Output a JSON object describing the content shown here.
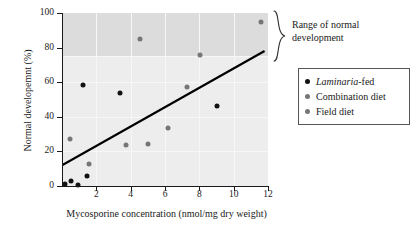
{
  "chart_data": {
    "type": "scatter",
    "title": "",
    "xlabel": "Mycosporine concentration (nmol/mg dry weight)",
    "ylabel": "Normal developemnt (%)",
    "xlim": [
      0,
      12
    ],
    "ylim": [
      0,
      100
    ],
    "xticks": [
      2,
      4,
      6,
      8,
      10,
      12
    ],
    "yticks": [
      0,
      20,
      40,
      60,
      80,
      100
    ],
    "xtick_labels": [
      "2",
      "4",
      "6",
      "8",
      "10",
      "12"
    ],
    "ytick_labels": [
      "0",
      "20",
      "40",
      "60",
      "80",
      "100"
    ],
    "grid": true,
    "legend_position": "right",
    "series": [
      {
        "name": "Laminaria-fed",
        "name_italic_prefix": "Laminaria",
        "name_suffix": "-fed",
        "color": "#111111",
        "marker": "circle",
        "points": [
          {
            "x": 0.15,
            "y": 1.0
          },
          {
            "x": 0.55,
            "y": 3.0
          },
          {
            "x": 0.95,
            "y": 0.5
          },
          {
            "x": 1.25,
            "y": 58.5
          },
          {
            "x": 1.45,
            "y": 5.5
          },
          {
            "x": 3.35,
            "y": 54.0
          },
          {
            "x": 9.0,
            "y": 46.5
          }
        ]
      },
      {
        "name": "Combination diet",
        "color": "#767676",
        "marker": "circle",
        "points": [
          {
            "x": 0.45,
            "y": 27.0
          },
          {
            "x": 1.6,
            "y": 12.5
          },
          {
            "x": 3.75,
            "y": 23.5
          },
          {
            "x": 5.0,
            "y": 24.0
          },
          {
            "x": 6.15,
            "y": 33.5
          },
          {
            "x": 7.3,
            "y": 57.5
          }
        ]
      },
      {
        "name": "Field diet",
        "color": "#767676",
        "marker": "circle",
        "points": [
          {
            "x": 4.55,
            "y": 85.0
          },
          {
            "x": 8.05,
            "y": 76.0
          },
          {
            "x": 11.6,
            "y": 95.0
          }
        ]
      }
    ],
    "trendline": {
      "x_start": 0.0,
      "y_start": 12.0,
      "x_end": 11.8,
      "y_end": 78.0,
      "color": "#000000"
    },
    "shaded_band": {
      "label": "Range of normal development",
      "y_min": 75,
      "y_max": 100,
      "color": "#dcdcdc"
    }
  },
  "annotation": {
    "line1": "Range of normal",
    "line2": "development"
  },
  "legend": {
    "items": [
      {
        "label_italic": "Laminaria",
        "label_rest": "-fed",
        "color": "#111111"
      },
      {
        "label_italic": "",
        "label_rest": "Combination diet",
        "color": "#767676"
      },
      {
        "label_italic": "",
        "label_rest": "Field diet",
        "color": "#767676"
      }
    ]
  }
}
